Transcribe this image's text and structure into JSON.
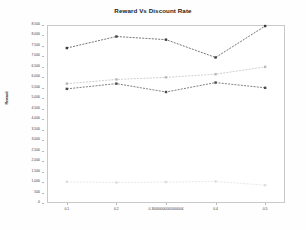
{
  "chart_data": {
    "type": "line",
    "title": "Reward Vs Discount Rate",
    "xlabel": "",
    "ylabel": "Reward",
    "x": [
      0.1,
      0.2,
      0.30000000000000004,
      0.4,
      0.5
    ],
    "xtick_labels": [
      "0.1",
      "0.2",
      "0.30000000000000004",
      "0.4",
      "0.5"
    ],
    "ytick_labels": [
      "0",
      "500",
      "1,000",
      "1,500",
      "2,000",
      "2,500",
      "3,000",
      "3,500",
      "4,000",
      "4,500",
      "5,000",
      "5,500",
      "6,000",
      "6,500",
      "7,000",
      "7,500",
      "8,000",
      "8,500"
    ],
    "ytick_values": [
      0,
      500,
      1000,
      1500,
      2000,
      2500,
      3000,
      3500,
      4000,
      4500,
      5000,
      5500,
      6000,
      6500,
      7000,
      7500,
      8000,
      8500
    ],
    "ylim": [
      0,
      8500
    ],
    "xlim": [
      0.06,
      0.54
    ],
    "grid": false,
    "legend": "none",
    "series": [
      {
        "name": "series-1",
        "color": "#3b3b3b",
        "linestyle": "dashed",
        "marker": "square",
        "values": [
          7400,
          7950,
          7800,
          6950,
          8450
        ]
      },
      {
        "name": "series-2",
        "color": "#b9b9b9",
        "linestyle": "dashed",
        "marker": "square",
        "values": [
          5700,
          5900,
          6000,
          6150,
          6500
        ]
      },
      {
        "name": "series-3",
        "color": "#4a4a4a",
        "linestyle": "dashed",
        "marker": "square",
        "values": [
          5450,
          5700,
          5300,
          5750,
          5500
        ]
      },
      {
        "name": "series-4",
        "color": "#dedede",
        "linestyle": "dashed",
        "marker": "square",
        "values": [
          1010,
          980,
          1000,
          1030,
          850
        ]
      }
    ]
  }
}
